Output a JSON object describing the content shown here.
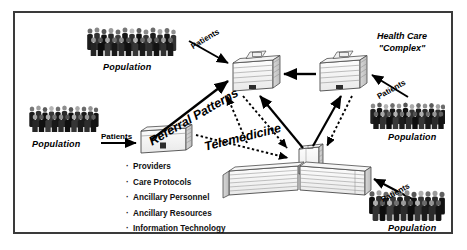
{
  "figure": {
    "border_color": "#3a3a3a",
    "background": "#ffffff"
  },
  "labels": {
    "health_care_complex_line1": "Health Care",
    "health_care_complex_line2": "\"Complex\"",
    "referral_patterns": "Referral Patterns",
    "telemedicine": "Telemedicine"
  },
  "populations": [
    {
      "id": "population-top-left",
      "label": "Population"
    },
    {
      "id": "population-left",
      "label": "Population"
    },
    {
      "id": "population-right-upper",
      "label": "Population"
    },
    {
      "id": "population-right-lower",
      "label": "Population"
    }
  ],
  "patient_flows": [
    {
      "id": "patients-top-left",
      "label": "Patients"
    },
    {
      "id": "patients-left",
      "label": "Patients"
    },
    {
      "id": "patients-right-upper",
      "label": "Patients"
    },
    {
      "id": "patients-right-lower",
      "label": "Patients"
    }
  ],
  "capability_list": {
    "bullet_glyph": "·",
    "items": [
      "Providers",
      "Care Protocols",
      "Ancillary Personnel",
      "Ancillary Resources",
      "Information Technology"
    ]
  },
  "nodes": [
    {
      "id": "clinic-left",
      "type": "small-clinic"
    },
    {
      "id": "hospital-center",
      "type": "mid-hospital"
    },
    {
      "id": "hospital-right",
      "type": "mid-hospital"
    },
    {
      "id": "tertiary-complex",
      "type": "large-complex"
    }
  ],
  "connections": [
    {
      "id": "referral-clinic-to-hospital-center",
      "style": "solid",
      "meaning": "Referral Patterns"
    },
    {
      "id": "referral-hospital-right-to-hospital-center",
      "style": "solid",
      "meaning": "Referral Patterns"
    },
    {
      "id": "referral-complex-to-hospital-center",
      "style": "solid",
      "meaning": "Referral Patterns"
    },
    {
      "id": "referral-complex-to-hospital-right",
      "style": "solid",
      "meaning": "Referral Patterns"
    },
    {
      "id": "telemedicine-hospital-center-to-complex",
      "style": "dotted",
      "meaning": "Telemedicine"
    },
    {
      "id": "telemedicine-hospital-right-to-complex",
      "style": "dotted",
      "meaning": "Telemedicine"
    },
    {
      "id": "telemedicine-clinic-to-complex",
      "style": "dotted",
      "meaning": "Telemedicine"
    }
  ]
}
